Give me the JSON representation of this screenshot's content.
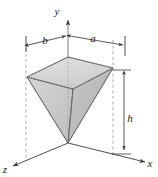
{
  "figure": {
    "background_color": "#ffffff",
    "line_color": "#3a3a3a",
    "dashed_color": "#8a8a8a",
    "axes": {
      "y_axis_label": "y",
      "x_axis_label": "x",
      "z_axis_label": "z"
    },
    "dimensions": {
      "width_left_label": "b",
      "width_right_label": "a",
      "height_label": "h"
    },
    "solid": {
      "name": "inverted-rectangular-pyramid",
      "apex_at_origin": true,
      "top_face_fill": "#d8d8d6",
      "front_left_face_fill": "#c9c9c7",
      "front_right_face_fill": "#bdbdbb",
      "top_face_points": "27,77 68,57 113,68 73,89",
      "left_face_points": "27,77 73,89 68,143",
      "right_face_points": "73,89 113,68 68,143",
      "edge_apex_to_left": "27,77 68,143",
      "edge_apex_to_front": "73,89 68,143",
      "edge_apex_to_right": "113,68 68,143",
      "edge_apex_to_back": "68,57 68,143"
    },
    "geometry": {
      "origin": {
        "x": 68,
        "y": 143
      },
      "y_axis_top": {
        "x": 68,
        "y": 17
      },
      "x_axis_end": {
        "x": 147,
        "y": 163
      },
      "z_axis_end": {
        "x": 11,
        "y": 167
      },
      "dim_bar_y": 43,
      "dim_tick_left_x": 26,
      "dim_tick_right_x": 125,
      "dim_center_x": 68,
      "h_bar_x": 124,
      "h_top_y": 72,
      "h_bottom_y": 152,
      "dash_left_x": 26,
      "dash_left_top_y": 48,
      "dash_left_bottom_y": 161,
      "dash_right_x": 113,
      "dash_right_top_y": 40,
      "dash_right_bottom_y": 156,
      "label_y_pos": {
        "x": 57,
        "y": 14
      },
      "label_x_pos": {
        "x": 148,
        "y": 166
      },
      "label_z_pos": {
        "x": 2,
        "y": 172
      },
      "label_b_pos": {
        "x": 44,
        "y": 43
      },
      "label_a_pos": {
        "x": 91,
        "y": 41
      },
      "label_h_pos": {
        "x": 127,
        "y": 120
      }
    }
  }
}
